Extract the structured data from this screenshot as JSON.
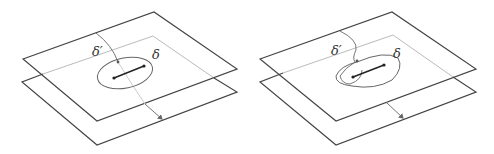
{
  "figure": {
    "panels": [
      {
        "id": "left",
        "labels": {
          "delta_prime": "δ′",
          "delta": "δ"
        },
        "description": "Two stacked parallel planes; closed loop δ encircles a segment on the upper plane; path δ′ passes through the upper plane and ends on the lower plane"
      },
      {
        "id": "right",
        "labels": {
          "delta_prime": "δ′",
          "delta": "δ"
        },
        "description": "Two stacked parallel planes; path δ′ wraps around the segment before passing to the lower plane; loop δ encircles the segment"
      }
    ],
    "colors": {
      "plane_edge": "#444444",
      "hidden_edge": "#bbbbbb",
      "curve": "#666666",
      "segment": "#222222"
    }
  }
}
